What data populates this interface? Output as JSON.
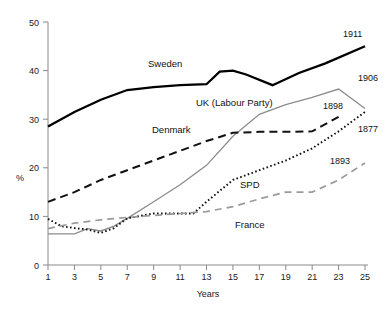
{
  "chart_data": {
    "type": "line",
    "title": "",
    "xlabel": "Years",
    "ylabel": "%",
    "xlim": [
      1,
      25
    ],
    "ylim": [
      0,
      50
    ],
    "grid": false,
    "legend": "inline-labels",
    "x_ticks": [
      "1",
      "3",
      "5",
      "7",
      "9",
      "11",
      "13",
      "15",
      "17",
      "19",
      "21",
      "23",
      "25"
    ],
    "y_ticks": [
      "0",
      "10",
      "20",
      "30",
      "40",
      "50"
    ],
    "x": [
      1,
      3,
      5,
      7,
      9,
      11,
      13,
      15,
      17,
      19,
      21,
      23,
      25
    ],
    "series": [
      {
        "name": "Sweden",
        "label": "Sweden",
        "end_label": "1911",
        "style": "solid-thick",
        "color": "#000000",
        "x": [
          1,
          3,
          5,
          7,
          9,
          11,
          13,
          14,
          15,
          16,
          18,
          20,
          22,
          25
        ],
        "values": [
          28.5,
          31.5,
          34,
          36,
          36.6,
          37,
          37.2,
          39.8,
          40,
          39.2,
          37,
          39.5,
          41.5,
          45
        ]
      },
      {
        "name": "UK (Labour Party)",
        "label": "UK (Labour Party)",
        "end_label": "1906",
        "style": "solid-thin-grey",
        "color": "#8c8c8c",
        "x": [
          1,
          2,
          3,
          4,
          5,
          6,
          7,
          9,
          11,
          13,
          15,
          17,
          19,
          21,
          23,
          25
        ],
        "values": [
          6.4,
          6.4,
          6.4,
          7.5,
          7.0,
          8.0,
          9.6,
          13.0,
          16.5,
          20.5,
          26.5,
          31.0,
          33.0,
          34.5,
          36.2,
          32.2
        ]
      },
      {
        "name": "Denmark",
        "label": "Denmark",
        "end_label": "1898",
        "style": "dashed-black",
        "color": "#111111",
        "x": [
          1,
          3,
          5,
          7,
          9,
          11,
          13,
          15,
          17,
          19,
          21,
          23
        ],
        "values": [
          13.0,
          15.0,
          17.5,
          19.5,
          21.5,
          23.5,
          25.5,
          27.2,
          27.4,
          27.4,
          27.5,
          30.5
        ]
      },
      {
        "name": "SPD",
        "label": "SPD",
        "end_label": "1877",
        "style": "dotted-black",
        "color": "#111111",
        "x": [
          1,
          2,
          3,
          4,
          5,
          6,
          7,
          9,
          11,
          12,
          13,
          15,
          17,
          19,
          21,
          23,
          25
        ],
        "values": [
          9.5,
          8.0,
          7.6,
          7.3,
          6.6,
          7.6,
          9.6,
          10.6,
          10.6,
          10.6,
          13.0,
          17.5,
          19.5,
          21.5,
          24.0,
          27.5,
          31.5
        ]
      },
      {
        "name": "France",
        "label": "France",
        "end_label": "1893",
        "style": "dashed-grey",
        "color": "#9a9a9a",
        "x": [
          1,
          3,
          5,
          7,
          9,
          11,
          13,
          15,
          17,
          19,
          21,
          23,
          25
        ],
        "values": [
          7.5,
          8.6,
          9.3,
          9.8,
          10.2,
          10.6,
          11.0,
          12.0,
          13.6,
          15.0,
          15.0,
          17.5,
          21.0
        ]
      }
    ],
    "inline_label_positions": [
      {
        "text": "Sweden",
        "x": 148,
        "y": 67
      },
      {
        "text": "UK (Labour Party)",
        "x": 196,
        "y": 106
      },
      {
        "text": "Denmark",
        "x": 152,
        "y": 133
      },
      {
        "text": "SPD",
        "x": 240,
        "y": 188
      },
      {
        "text": "France",
        "x": 235,
        "y": 228
      }
    ],
    "end_label_positions": [
      {
        "text": "1911",
        "x": 343,
        "y": 37
      },
      {
        "text": "1906",
        "x": 358,
        "y": 81
      },
      {
        "text": "1898",
        "x": 323,
        "y": 109
      },
      {
        "text": "1877",
        "x": 358,
        "y": 132
      },
      {
        "text": "1893",
        "x": 330,
        "y": 164
      }
    ]
  }
}
